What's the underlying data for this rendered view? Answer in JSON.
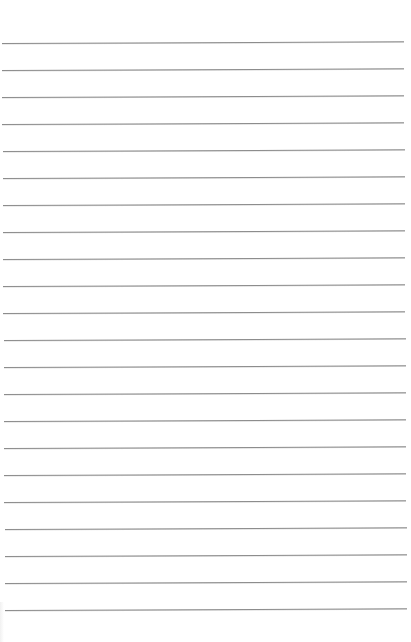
{
  "page": {
    "type": "lined-paper",
    "background_color": "#ffffff",
    "line_color": "#8c8c8c",
    "line_count": 22,
    "first_line_y": 43,
    "line_spacing": 27,
    "line_left_top": 2,
    "line_left_bottom": 5,
    "line_right_top": 404,
    "line_right_bottom": 407,
    "line_tilt_deg": -0.25
  }
}
